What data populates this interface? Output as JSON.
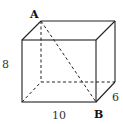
{
  "diagram": {
    "type": "rectangular-prism",
    "labels": {
      "vertex_top": "A",
      "vertex_bottom": "B",
      "height": "8",
      "length": "10",
      "depth": "6"
    },
    "colors": {
      "edge": "#222222",
      "text": "#333333",
      "background": "#ffffff"
    }
  }
}
